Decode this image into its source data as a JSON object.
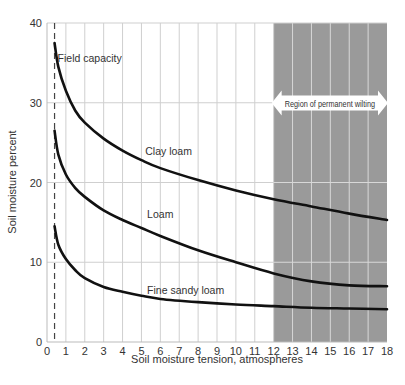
{
  "chart_data": {
    "type": "line",
    "title": "",
    "xlabel": "Soil moisture tension, atmospheres",
    "ylabel": "Soil moisture percent",
    "xlim": [
      0,
      18
    ],
    "ylim": [
      0,
      40
    ],
    "x_ticks": [
      0,
      1,
      2,
      3,
      4,
      5,
      6,
      7,
      8,
      9,
      10,
      11,
      12,
      13,
      14,
      15,
      16,
      17,
      18
    ],
    "y_ticks": [
      0,
      10,
      20,
      30,
      40
    ],
    "grid": true,
    "legend": "none (curves labeled inline)",
    "series": [
      {
        "name": "Clay loam",
        "x": [
          0.4,
          0.6,
          1.0,
          1.5,
          2,
          3,
          4,
          5,
          6,
          8,
          10,
          12,
          14,
          16,
          18
        ],
        "y": [
          37.5,
          34.5,
          31.5,
          29.0,
          27.5,
          25.5,
          24.0,
          22.8,
          21.8,
          20.3,
          19.0,
          17.9,
          17.0,
          16.1,
          15.3
        ]
      },
      {
        "name": "Loam",
        "x": [
          0.4,
          0.6,
          1.0,
          1.5,
          2,
          3,
          4,
          5,
          6,
          8,
          10,
          12,
          14,
          16,
          18
        ],
        "y": [
          26.5,
          23.5,
          21.0,
          19.3,
          18.2,
          16.5,
          15.3,
          14.3,
          13.3,
          11.5,
          10.0,
          8.6,
          7.6,
          7.1,
          7.0
        ]
      },
      {
        "name": "Fine sandy loam",
        "x": [
          0.4,
          0.6,
          1.0,
          1.5,
          2,
          3,
          4,
          5,
          6,
          8,
          10,
          12,
          14,
          16,
          18
        ],
        "y": [
          14.5,
          12.2,
          10.4,
          9.0,
          8.0,
          6.9,
          6.3,
          5.8,
          5.4,
          5.0,
          4.7,
          4.5,
          4.3,
          4.2,
          4.1
        ]
      }
    ],
    "annotations": [
      {
        "text": "Field capacity",
        "type": "dashed vertical line",
        "x": 0.4
      },
      {
        "text": "Region of permanent wilting",
        "type": "shaded region with double arrow",
        "x_range": [
          12,
          18
        ]
      },
      {
        "text": "Clay loam",
        "x": 5.2,
        "y": 23.5
      },
      {
        "text": "Loam",
        "x": 5.3,
        "y": 15.5
      },
      {
        "text": "Fine sandy loam",
        "x": 5.3,
        "y": 6.0
      }
    ]
  },
  "colors": {
    "curve": "#111111",
    "grid": "#cfcfcf",
    "shade": "#9a9a9a",
    "shade_grid": "#d8d8d8",
    "text": "#333333"
  }
}
